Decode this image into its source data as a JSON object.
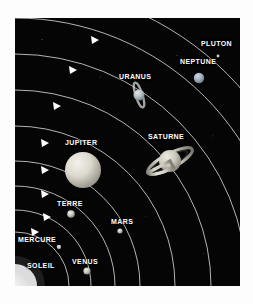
{
  "figure": {
    "language": "fr",
    "background_color": "#050505",
    "frame_color": "#ffffff",
    "orbit_color": "#d8d8d8",
    "label_color": "#ffffff"
  },
  "sun": {
    "name": "SOLEIL",
    "label": "SOLEIL",
    "color": "#ffffff",
    "label_x": 12,
    "label_y": 244
  },
  "planets": [
    {
      "name": "MERCURE",
      "label": "MERCURE",
      "label_x": 3,
      "label_y": 218,
      "body_cx": 44,
      "body_cy": 229,
      "radius": 2.2,
      "color": "#b9b9b9",
      "orbit_index": 1,
      "has_rings": false
    },
    {
      "name": "VENUS",
      "label": "VENUS",
      "label_x": 57,
      "label_y": 240,
      "body_cx": 72,
      "body_cy": 253,
      "radius": 3.6,
      "color": "#d6d2c4",
      "orbit_index": 2,
      "has_rings": false
    },
    {
      "name": "TERRE",
      "label": "TERRE",
      "label_x": 42,
      "label_y": 182,
      "body_cx": 56,
      "body_cy": 196,
      "radius": 3.8,
      "color": "#c9cfd6",
      "orbit_index": 3,
      "has_rings": false
    },
    {
      "name": "MARS",
      "label": "MARS",
      "label_x": 96,
      "label_y": 200,
      "body_cx": 105,
      "body_cy": 213,
      "radius": 2.6,
      "color": "#b8a99b",
      "orbit_index": 4,
      "has_rings": false
    },
    {
      "name": "JUPITER",
      "label": "JUPITER",
      "label_x": 50,
      "label_y": 121,
      "body_cx": 68,
      "body_cy": 152,
      "radius": 18,
      "color": "#dedbd2",
      "orbit_index": 5,
      "has_rings": false
    },
    {
      "name": "SATURNE",
      "label": "SATURNE",
      "label_x": 133,
      "label_y": 115,
      "body_cx": 155,
      "body_cy": 143,
      "radius": 11,
      "color": "#cfcdc2",
      "orbit_index": 6,
      "has_rings": true,
      "ring_tilt_deg": -28
    },
    {
      "name": "URANUS",
      "label": "URANUS",
      "label_x": 104,
      "label_y": 55,
      "body_cx": 124,
      "body_cy": 77,
      "radius": 5.5,
      "color": "#b6c2c4",
      "orbit_index": 7,
      "has_rings": true,
      "ring_tilt_deg": 72
    },
    {
      "name": "NEPTUNE",
      "label": "NEPTUNE",
      "label_x": 165,
      "label_y": 40,
      "body_cx": 184,
      "body_cy": 60,
      "radius": 5.2,
      "color": "#9fb0bd",
      "orbit_index": 8,
      "has_rings": false
    },
    {
      "name": "PLUTON",
      "label": "PLUTON",
      "label_x": 186,
      "label_y": 22,
      "body_cx": 203,
      "body_cy": 38,
      "radius": 1.4,
      "color": "#cfcfcf",
      "orbit_index": 9,
      "has_rings": false
    }
  ],
  "orbits": [
    {
      "index": 1,
      "planet": "MERCURE",
      "radius": 54,
      "arrow": true
    },
    {
      "index": 2,
      "planet": "VENUS",
      "radius": 76,
      "arrow": true
    },
    {
      "index": 3,
      "planet": "TERRE",
      "radius": 100,
      "arrow": true
    },
    {
      "index": 4,
      "planet": "MARS",
      "radius": 125,
      "arrow": true
    },
    {
      "index": 5,
      "planet": "JUPITER",
      "radius": 160,
      "arrow": true
    },
    {
      "index": 6,
      "planet": "SATURNE",
      "radius": 196,
      "arrow": true
    },
    {
      "index": 7,
      "planet": "URANUS",
      "radius": 232,
      "arrow": true
    },
    {
      "index": 8,
      "planet": "NEPTUNE",
      "radius": 268,
      "arrow": true
    },
    {
      "index": 9,
      "planet": "PLUTON",
      "radius": 300,
      "arrow": false
    }
  ],
  "notes": {
    "orbit_direction": "counterclockwise",
    "sun_position": "bottom-left corner",
    "view": "oblique"
  }
}
